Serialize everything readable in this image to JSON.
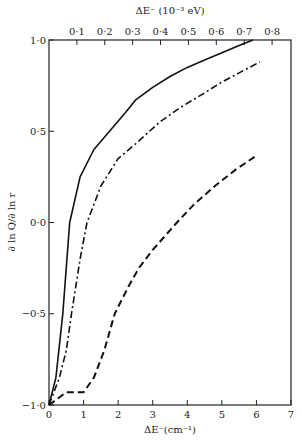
{
  "chart_data": {
    "type": "line",
    "title": "",
    "xlabel": "ΔE⁻(cm⁻¹)",
    "x2label": "ΔE⁻ (10⁻³ eV)",
    "ylabel": "∂ ln Q/∂ ln r",
    "xlim": [
      0,
      7
    ],
    "ylim": [
      -1.0,
      1.0
    ],
    "x_ticks": [
      "0",
      "1",
      "2",
      "3",
      "4",
      "5",
      "6",
      "7"
    ],
    "x2_ticks": [
      "0·1",
      "0·2",
      "0·3",
      "0·4",
      "0·5",
      "0·6",
      "0·7",
      "0·8"
    ],
    "y_ticks": [
      "−1·0",
      "−0·5",
      "0·0",
      "0·5",
      "1·0"
    ],
    "grid": false,
    "series": [
      {
        "name": "solid",
        "style": "solid",
        "x": [
          0,
          0.2,
          0.4,
          0.6,
          0.9,
          1.3,
          1.75,
          2.2,
          2.5,
          3.0,
          3.5,
          4.0,
          4.5,
          5.0,
          5.5,
          5.9
        ],
        "y": [
          -1.0,
          -0.85,
          -0.5,
          0.0,
          0.25,
          0.4,
          0.5,
          0.6,
          0.67,
          0.74,
          0.8,
          0.85,
          0.89,
          0.93,
          0.97,
          1.0
        ]
      },
      {
        "name": "dash-dot",
        "style": "dashdot",
        "x": [
          0,
          0.3,
          0.5,
          0.65,
          0.9,
          1.1,
          1.5,
          2.0,
          2.5,
          3.2,
          3.8,
          4.5,
          5.0,
          5.5,
          6.1
        ],
        "y": [
          -1.0,
          -0.85,
          -0.7,
          -0.5,
          -0.2,
          0.0,
          0.2,
          0.35,
          0.43,
          0.55,
          0.63,
          0.71,
          0.77,
          0.82,
          0.88
        ]
      },
      {
        "name": "dashed",
        "style": "dashed",
        "x": [
          0,
          0.5,
          1.0,
          1.3,
          1.6,
          1.9,
          2.3,
          2.6,
          3.0,
          3.7,
          4.2,
          4.8,
          5.4,
          5.95
        ],
        "y": [
          -1.0,
          -0.93,
          -0.93,
          -0.85,
          -0.7,
          -0.5,
          -0.35,
          -0.25,
          -0.15,
          0.0,
          0.1,
          0.2,
          0.29,
          0.36
        ]
      }
    ]
  }
}
